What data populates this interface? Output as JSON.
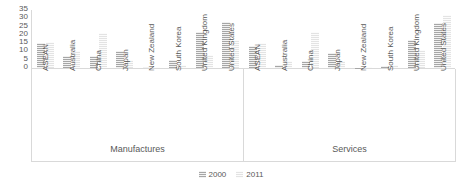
{
  "chart_data": {
    "type": "bar",
    "title": "",
    "subtitle": "",
    "xlabel": "",
    "ylabel": "",
    "ylim": [
      0,
      35
    ],
    "yticks": [
      0,
      5,
      10,
      15,
      20,
      25,
      30,
      35
    ],
    "grid": false,
    "legend_position": "bottom",
    "categories": [
      "ASEAN",
      "Australia",
      "China",
      "Japan",
      "New Zealand",
      "South Korea",
      "United Kingdom",
      "United States"
    ],
    "groups": [
      {
        "label": "Manufactures",
        "series": [
          {
            "name": "2000",
            "values": [
              15,
              7,
              7,
              10,
              0.5,
              5,
              22,
              28
            ]
          },
          {
            "name": "2011",
            "values": [
              16,
              10,
              21,
              5,
              0.4,
              2,
              8,
              17
            ]
          }
        ]
      },
      {
        "label": "Services",
        "series": [
          {
            "name": "2000",
            "values": [
              13,
              2,
              4,
              9,
              0.3,
              1.5,
              17,
              27
            ]
          },
          {
            "name": "2011",
            "values": [
              15,
              4,
              22,
              4,
              0.5,
              2,
              11,
              32
            ]
          }
        ]
      }
    ],
    "series_names": [
      "2000",
      "2011"
    ],
    "series_colors": [
      "#a6a6a6",
      "#e3e3e3"
    ],
    "legend": [
      {
        "label": "2000",
        "color": "#a6a6a6"
      },
      {
        "label": "2011",
        "color": "#e3e3e3"
      }
    ]
  }
}
